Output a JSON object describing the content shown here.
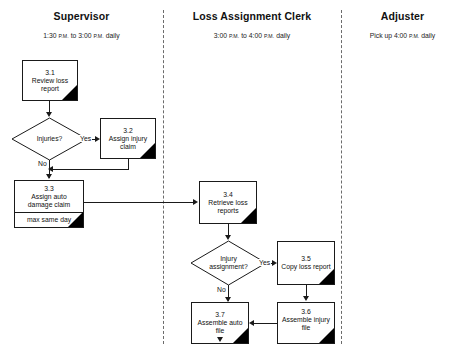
{
  "diagram": {
    "type": "swimlane-flowchart"
  },
  "lanes": [
    {
      "id": "supervisor",
      "title": "Supervisor",
      "schedule_prefix": "1:30 ",
      "schedule_am1": "P.M.",
      "schedule_mid": " to 3:00 ",
      "schedule_am2": "P.M.",
      "schedule_suffix": " daily"
    },
    {
      "id": "loss-assignment-clerk",
      "title": "Loss Assignment Clerk",
      "schedule_prefix": "3:00 ",
      "schedule_am1": "P.M.",
      "schedule_mid": " to 4:00 ",
      "schedule_am2": "P.M.",
      "schedule_suffix": " daily"
    },
    {
      "id": "adjuster",
      "title": "Adjuster",
      "schedule_prefix": "Pick up 4:00 ",
      "schedule_am1": "P.M.",
      "schedule_mid": "",
      "schedule_am2": "",
      "schedule_suffix": " daily"
    }
  ],
  "nodes": {
    "step31": {
      "number": "3.1",
      "label": "Review loss report"
    },
    "step32": {
      "number": "3.2",
      "label": "Assign injury claim"
    },
    "step33": {
      "number": "3.3",
      "label_line1": "Assign auto",
      "label_line2": "damage claim",
      "note": "max same day"
    },
    "step34": {
      "number": "3.4",
      "label_line1": "Retrieve loss",
      "label_line2": "reports"
    },
    "step35": {
      "number": "3.5",
      "label": "Copy loss report"
    },
    "step36": {
      "number": "3.6",
      "label_line1": "Assemble injury",
      "label_line2": "file"
    },
    "step37": {
      "number": "3.7",
      "label": "Assemble auto file"
    }
  },
  "decisions": {
    "injuries": {
      "label": "Injuries?"
    },
    "injury_assignment": {
      "label_line1": "Injury",
      "label_line2": "assignment?"
    }
  },
  "edge_labels": {
    "injuries_yes": "Yes",
    "injuries_no": "No",
    "assignment_yes": "Yes",
    "assignment_no": "No"
  },
  "colors": {
    "stroke": "#1a1a1a",
    "corner_marker": "#000000",
    "lane_divider": "#6b6b6b",
    "background": "#ffffff"
  }
}
